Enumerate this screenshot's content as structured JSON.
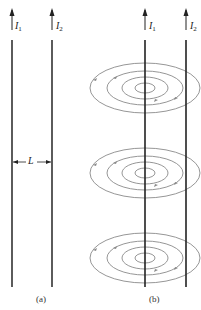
{
  "panel_a": {
    "caption": "(a)",
    "wire1_label": "I",
    "wire1_sub": "1",
    "wire2_label": "I",
    "wire2_sub": "2",
    "separation_label": "L"
  },
  "panel_b": {
    "caption": "(b)",
    "wire1_label": "I",
    "wire1_sub": "1",
    "wire2_label": "I",
    "wire2_sub": "2",
    "field_loop_groups": 3
  },
  "colors": {
    "wire": "#222222",
    "field_lines": "#888888",
    "text": "#222222"
  }
}
